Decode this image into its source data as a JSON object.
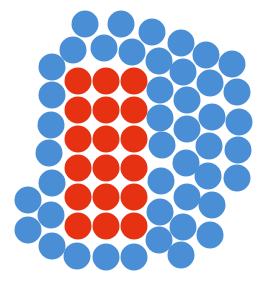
{
  "diagram": {
    "type": "dot-cluster",
    "radius": 13.5,
    "colors": {
      "blue": "#4a8fd6",
      "red": "#e63212",
      "background": "#ffffff"
    },
    "groups": [
      {
        "name": "red",
        "count": 18,
        "color": "#e63212",
        "points": [
          [
            78,
            81
          ],
          [
            106,
            81
          ],
          [
            134,
            81
          ],
          [
            78,
            110
          ],
          [
            106,
            110
          ],
          [
            134,
            110
          ],
          [
            78,
            139
          ],
          [
            106,
            139
          ],
          [
            134,
            139
          ],
          [
            78,
            168
          ],
          [
            106,
            168
          ],
          [
            134,
            168
          ],
          [
            78,
            197
          ],
          [
            106,
            197
          ],
          [
            134,
            197
          ],
          [
            78,
            226
          ],
          [
            106,
            226
          ],
          [
            134,
            226
          ]
        ]
      },
      {
        "name": "blue",
        "count": 50,
        "color": "#4a8fd6",
        "points": [
          [
            85,
            24
          ],
          [
            121,
            24
          ],
          [
            152,
            32
          ],
          [
            181,
            43
          ],
          [
            206,
            55
          ],
          [
            232,
            64
          ],
          [
            73,
            50
          ],
          [
            104,
            48
          ],
          [
            132,
            52
          ],
          [
            159,
            61
          ],
          [
            183,
            72
          ],
          [
            210,
            83
          ],
          [
            237,
            92
          ],
          [
            52,
            67
          ],
          [
            52,
            95
          ],
          [
            51,
            125
          ],
          [
            49,
            153
          ],
          [
            52,
            183
          ],
          [
            51,
            215
          ],
          [
            52,
            246
          ],
          [
            28,
            200
          ],
          [
            28,
            230
          ],
          [
            77,
            256
          ],
          [
            106,
            257
          ],
          [
            134,
            257
          ],
          [
            160,
            90
          ],
          [
            160,
            118
          ],
          [
            162,
            145
          ],
          [
            161,
            181
          ],
          [
            160,
            212
          ],
          [
            159,
            240
          ],
          [
            187,
            100
          ],
          [
            187,
            129
          ],
          [
            186,
            163
          ],
          [
            187,
            197
          ],
          [
            183,
            227
          ],
          [
            181,
            255
          ],
          [
            212,
            117
          ],
          [
            209,
            146
          ],
          [
            208,
            176
          ],
          [
            212,
            205
          ],
          [
            210,
            235
          ],
          [
            239,
            122
          ],
          [
            238,
            150
          ],
          [
            237,
            178
          ]
        ]
      }
    ]
  }
}
